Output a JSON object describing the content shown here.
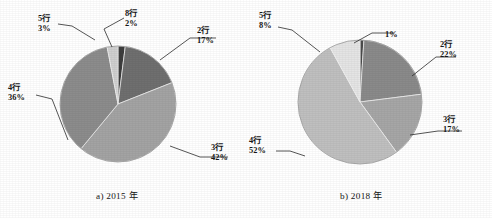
{
  "figure": {
    "background": "#ffffff",
    "width": 492,
    "height": 218
  },
  "charts": [
    {
      "caption": "a) 2015 年",
      "caption_x": 96,
      "caption_y": 191,
      "cx": 118,
      "cy": 104,
      "r": 58,
      "start_angle": -90,
      "labels": [
        {
          "name": "5行",
          "pct": "3%",
          "x": 38,
          "y": 16,
          "align": "left"
        },
        {
          "name": "8行",
          "pct": "2%",
          "x": 125,
          "y": 11,
          "align": "left"
        },
        {
          "name": "2行",
          "pct": "17%",
          "x": 197,
          "y": 28,
          "align": "left"
        },
        {
          "name": "4行",
          "pct": "36%",
          "x": 8,
          "y": 85,
          "align": "left"
        },
        {
          "name": "3行",
          "pct": "42%",
          "x": 211,
          "y": 145,
          "align": "left"
        }
      ]
    },
    {
      "caption": "b) 2018 年",
      "caption_x": 340,
      "caption_y": 191,
      "cx": 360,
      "cy": 102,
      "r": 62,
      "start_angle": -90,
      "labels": [
        {
          "name": "5行",
          "pct": "8%",
          "x": 259,
          "y": 13,
          "align": "left"
        },
        {
          "name": "",
          "pct": "1%",
          "x": 385,
          "y": 28,
          "align": "left"
        },
        {
          "name": "2行",
          "pct": "22%",
          "x": 440,
          "y": 42,
          "align": "left"
        },
        {
          "name": "3行",
          "pct": "17%",
          "x": 443,
          "y": 117,
          "align": "left"
        },
        {
          "name": "4行",
          "pct": "52%",
          "x": 249,
          "y": 138,
          "align": "left"
        }
      ]
    }
  ],
  "chart_data": [
    {
      "type": "pie",
      "title": "a) 2015 年",
      "categories": [
        "8行",
        "2行",
        "3行",
        "4行",
        "5行"
      ],
      "values": [
        2,
        17,
        42,
        36,
        3
      ],
      "labels": [
        "8行 2%",
        "2行 17%",
        "3行 42%",
        "4行 36%",
        "5行 3%"
      ],
      "colors": [
        "#3d3d3d",
        "#6f6f6f",
        "#a3a3a3",
        "#8c8c8c",
        "#cfcfcf"
      ],
      "start_angle_deg": -90,
      "direction": "clockwise",
      "legend": "none",
      "grid": false
    },
    {
      "type": "pie",
      "title": "b) 2018 年",
      "categories": [
        "1%",
        "2行",
        "3行",
        "4行",
        "5行"
      ],
      "values": [
        1,
        22,
        17,
        52,
        8
      ],
      "labels": [
        "1%",
        "2行 22%",
        "3行 17%",
        "4行 52%",
        "5行 8%"
      ],
      "colors": [
        "#4a4a4a",
        "#8a8a8a",
        "#a6a6a6",
        "#bfbfbf",
        "#e4e4e4"
      ],
      "start_angle_deg": -90,
      "direction": "clockwise",
      "legend": "none",
      "grid": false
    }
  ],
  "leaders": {
    "stroke": "#2b2b2b",
    "width": 0.8
  }
}
